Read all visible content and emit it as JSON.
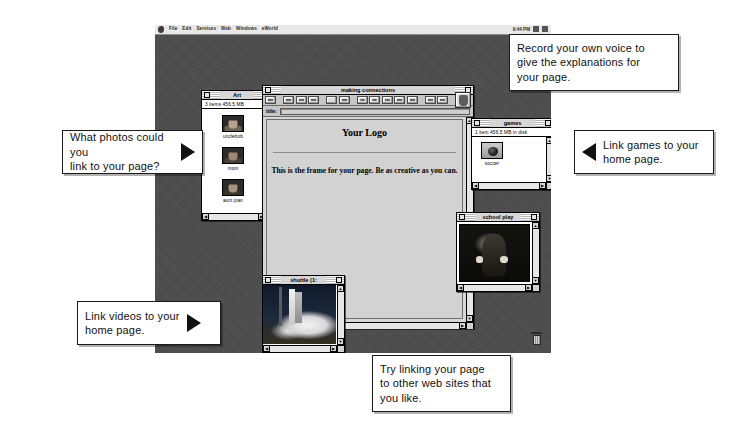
{
  "screen": {
    "menubar": {
      "apple_icon": "apple-icon",
      "items": [
        "File",
        "Edit",
        "Services",
        "Web",
        "Windows",
        "eWorld"
      ],
      "clock": "9:44 PM",
      "tray_icons": [
        "app-switcher-icon",
        "balloon-help-icon"
      ]
    }
  },
  "windows": {
    "art": {
      "title": "Art",
      "info": "3 items   456.5 MB",
      "icons": [
        {
          "label": "unclebob",
          "thumb": "portrait-photo"
        },
        {
          "label": "mom",
          "thumb": "portrait-photo"
        },
        {
          "label": "aunt joan",
          "thumb": "portrait-photo"
        }
      ]
    },
    "making_connections": {
      "title": "making connections",
      "title_label": "title:",
      "title_value": "",
      "logo_text": "Your Logo",
      "body_text": "This is the frame for your page.\nBe as creative as you can.",
      "toolbar_icons": [
        "align-icon",
        "text-a-icon",
        "text-a-icon",
        "text-a-icon",
        "line-icon",
        "shape-icon",
        "clock-icon",
        "record-icon",
        "video-icon",
        "chart-icon",
        "image-icon",
        "page-icon",
        "link-icon"
      ],
      "paint-button": "paint-bucket-icon"
    },
    "games": {
      "title": "games",
      "info": "1 item   456.5 MB in disk",
      "icons": [
        {
          "label": "soccer",
          "thumb": "soccer-ball-photo"
        }
      ]
    },
    "school_play": {
      "title": "school play",
      "photo": "school-play-photo"
    },
    "shuttle": {
      "title": "shuttle (1:",
      "photo": "shuttle-launch-photo"
    }
  },
  "callouts": {
    "record_voice": {
      "text": "Record your own voice to\ngive the explanations for\nyour page.",
      "arrow": "none"
    },
    "photos": {
      "text": "What photos could you\nlink to your page?",
      "arrow": "right"
    },
    "games": {
      "text": "Link games to your\nhome page.",
      "arrow": "left"
    },
    "videos": {
      "text": "Link videos to your\nhome page.",
      "arrow": "right"
    },
    "web_sites": {
      "text": "Try linking your page\nto other web sites that\nyou like.",
      "arrow": "none"
    }
  },
  "desktop": {
    "trash_label": "trash-icon"
  },
  "colors": {
    "desktop_bg": "#4d4d4d",
    "window_chrome": "#c9c9c9",
    "callout_bg": "#ffffff",
    "ink": "#111111"
  }
}
